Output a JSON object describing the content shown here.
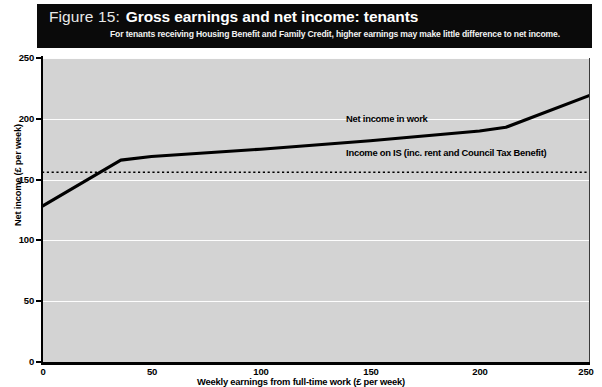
{
  "header": {
    "figure_number": "Figure 15:",
    "title": "Gross earnings and net income: tenants",
    "subtitle": "For tenants receiving Housing Benefit and Family Credit, higher earnings may make little difference to net income."
  },
  "chart_data": {
    "type": "line",
    "title": "Gross earnings and net income: tenants",
    "subtitle": "For tenants receiving Housing Benefit and Family Credit, higher earnings may make little difference to net income.",
    "xlabel": "Weekly earnings from full-time work (£ per week)",
    "ylabel": "Net income (£ per week)",
    "xlim": [
      0,
      250
    ],
    "ylim": [
      0,
      250
    ],
    "xticks": [
      "0",
      "50",
      "100",
      "150",
      "200",
      "250"
    ],
    "yticks": [
      "0",
      "50",
      "100",
      "150",
      "200",
      "250"
    ],
    "grid": "horizontal",
    "legend": "inline-annotations",
    "series": [
      {
        "name": "Net income in work",
        "style": "solid",
        "color": "#000000",
        "points": [
          {
            "x": 0,
            "y": 128
          },
          {
            "x": 36,
            "y": 166
          },
          {
            "x": 50,
            "y": 169
          },
          {
            "x": 100,
            "y": 175
          },
          {
            "x": 150,
            "y": 182
          },
          {
            "x": 200,
            "y": 190
          },
          {
            "x": 212,
            "y": 193
          },
          {
            "x": 250,
            "y": 219
          }
        ]
      },
      {
        "name": "Income on IS  (inc. rent and Council Tax Benefit)",
        "style": "dotted",
        "color": "#000000",
        "constant_value": 156,
        "points": [
          {
            "x": 0,
            "y": 156
          },
          {
            "x": 250,
            "y": 156
          }
        ]
      }
    ],
    "annotations": [
      {
        "text": "Net income in work",
        "x": 139,
        "y": 200
      },
      {
        "text": "Income on IS  (inc. rent and Council Tax Benefit)",
        "x": 139,
        "y": 172
      }
    ],
    "plot_background": "#d3d3d3",
    "gridline_color": "#fdfdfd",
    "banner_background": "#0a0a0a"
  }
}
